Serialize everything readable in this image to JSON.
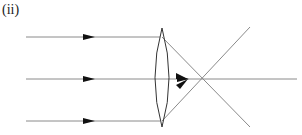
{
  "figure": {
    "label": "(ii)",
    "colors": {
      "ray": "#8a8a8a",
      "arrow": "#111111",
      "lens": "#333333"
    }
  }
}
